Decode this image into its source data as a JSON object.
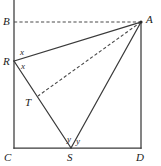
{
  "figure": {
    "kind": "geometry-diagram",
    "canvas": {
      "width": 161,
      "height": 166,
      "background": "#ffffff"
    },
    "colors": {
      "stroke": "#3a3a3a",
      "dashed_stroke": "#4a4a4a",
      "label_text": "#1b1b1b",
      "angle_text": "#2a2a2a"
    },
    "points": [
      {
        "id": "B",
        "label": "B",
        "x": 14,
        "y": 22,
        "label_x": 3,
        "label_y": 16
      },
      {
        "id": "A",
        "label": "A",
        "x": 141,
        "y": 22,
        "label_x": 146,
        "label_y": 14
      },
      {
        "id": "R",
        "label": "R",
        "x": 14,
        "y": 61,
        "label_x": 3,
        "label_y": 56
      },
      {
        "id": "T",
        "label": "T",
        "x": 38,
        "y": 96,
        "label_x": 25,
        "label_y": 97
      },
      {
        "id": "C",
        "label": "C",
        "x": 14,
        "y": 148,
        "label_x": 4,
        "label_y": 152
      },
      {
        "id": "S",
        "label": "S",
        "x": 71,
        "y": 148,
        "label_x": 67,
        "label_y": 152
      },
      {
        "id": "D",
        "label": "D",
        "x": 141,
        "y": 148,
        "label_x": 136,
        "label_y": 152
      }
    ],
    "solid_segments": [
      {
        "name": "left-side-BC",
        "from": "B",
        "to": "C",
        "x1": 14,
        "y1": 0,
        "x2": 14,
        "y2": 148
      },
      {
        "name": "bottom-side-CD",
        "from": "C",
        "to": "D",
        "x1": 14,
        "y1": 148,
        "x2": 141,
        "y2": 148
      },
      {
        "name": "right-side-AD",
        "from": "A",
        "to": "D",
        "x1": 141,
        "y1": 22,
        "x2": 141,
        "y2": 148
      },
      {
        "name": "segment-RA",
        "from": "R",
        "to": "A",
        "x1": 14,
        "y1": 61,
        "x2": 141,
        "y2": 22
      },
      {
        "name": "segment-RS",
        "from": "R",
        "to": "S",
        "x1": 14,
        "y1": 61,
        "x2": 71,
        "y2": 148
      },
      {
        "name": "segment-SA",
        "from": "S",
        "to": "A",
        "x1": 71,
        "y1": 148,
        "x2": 141,
        "y2": 22
      }
    ],
    "dashed_segments": [
      {
        "name": "segment-BA",
        "from": "B",
        "to": "A",
        "x1": 14,
        "y1": 22,
        "x2": 141,
        "y2": 22
      },
      {
        "name": "segment-AT",
        "from": "A",
        "to": "T",
        "x1": 141,
        "y1": 22,
        "x2": 38,
        "y2": 96
      }
    ],
    "angle_labels": [
      {
        "id": "x-upper",
        "label": "x",
        "x": 20,
        "y": 48,
        "at_vertex": "R"
      },
      {
        "id": "x-lower",
        "label": "x",
        "x": 21,
        "y": 62,
        "at_vertex": "R"
      },
      {
        "id": "y-left",
        "label": "y",
        "x": 67,
        "y": 135,
        "at_vertex": "S"
      },
      {
        "id": "y-right",
        "label": "y",
        "x": 76,
        "y": 137,
        "at_vertex": "S"
      }
    ]
  }
}
